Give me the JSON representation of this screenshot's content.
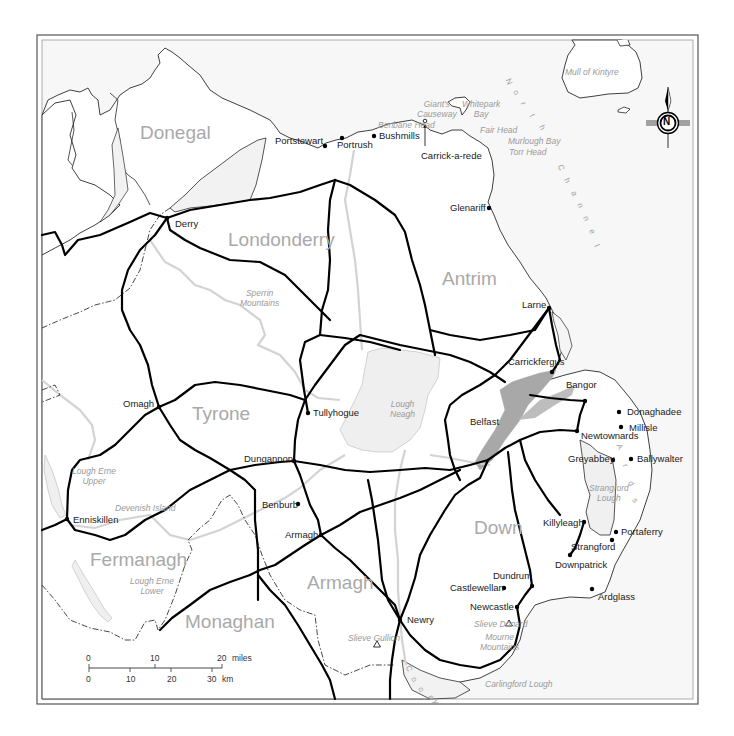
{
  "map": {
    "title": "Northern Ireland road map",
    "colors": {
      "frame": "#444444",
      "coast": "#2a2a2a",
      "road": "#000000",
      "border": "#333333",
      "river": "#d0d0d0",
      "lough": "#efefef",
      "belfast_lough": "#a8a8a8",
      "sea_label": "#a0a0a0",
      "county_label": "#a9a9a9",
      "town_label": "#1a1a1a"
    },
    "counties": [
      {
        "name": "Donegal",
        "x": 140,
        "y": 123
      },
      {
        "name": "Londonderry",
        "x": 228,
        "y": 230
      },
      {
        "name": "Antrim",
        "x": 442,
        "y": 269
      },
      {
        "name": "Tyrone",
        "x": 192,
        "y": 404
      },
      {
        "name": "Fermanagh",
        "x": 90,
        "y": 550
      },
      {
        "name": "Armagh",
        "x": 307,
        "y": 573
      },
      {
        "name": "Monaghan",
        "x": 185,
        "y": 612
      },
      {
        "name": "Down",
        "x": 474,
        "y": 518
      }
    ],
    "towns": [
      {
        "name": "Portstewart",
        "x": 275,
        "y": 136,
        "dotx": 325,
        "doty": 146
      },
      {
        "name": "Portrush",
        "x": 337,
        "y": 140,
        "dotx": 342,
        "doty": 138
      },
      {
        "name": "Bushmills",
        "x": 379,
        "y": 131,
        "dotx": 374,
        "doty": 136
      },
      {
        "name": "Carrick-a-rede",
        "x": 421,
        "y": 151,
        "dotx": 425,
        "doty": 124
      },
      {
        "name": "Glenariff",
        "x": 450,
        "y": 203,
        "dotx": 489,
        "doty": 208
      },
      {
        "name": "Derry",
        "x": 175,
        "y": 219,
        "dotx": 167,
        "doty": 218
      },
      {
        "name": "Larne",
        "x": 522,
        "y": 300,
        "dotx": 549,
        "doty": 308
      },
      {
        "name": "Carrickfergus",
        "x": 508,
        "y": 357,
        "dotx": 552,
        "doty": 372
      },
      {
        "name": "Bangor",
        "x": 566,
        "y": 380,
        "dotx": 585,
        "doty": 401
      },
      {
        "name": "Donaghadee",
        "x": 627,
        "y": 407,
        "dotx": 619,
        "doty": 412
      },
      {
        "name": "Millisle",
        "x": 629,
        "y": 423,
        "dotx": 621,
        "doty": 427
      },
      {
        "name": "Newtownards",
        "x": 581,
        "y": 431,
        "dotx": 577,
        "doty": 431
      },
      {
        "name": "Belfast",
        "x": 470,
        "y": 417,
        "dotx": null,
        "doty": null
      },
      {
        "name": "Tullyhogue",
        "x": 313,
        "y": 408,
        "dotx": 308,
        "doty": 413
      },
      {
        "name": "Omagh",
        "x": 123,
        "y": 399,
        "dotx": 159,
        "doty": 407
      },
      {
        "name": "Greyabbey",
        "x": 568,
        "y": 454,
        "dotx": 613,
        "doty": 460
      },
      {
        "name": "Ballywalter",
        "x": 637,
        "y": 454,
        "dotx": 631,
        "doty": 459
      },
      {
        "name": "Dungannon",
        "x": 244,
        "y": 454,
        "dotx": 294,
        "doty": 461
      },
      {
        "name": "Enniskillen",
        "x": 73,
        "y": 515,
        "dotx": 67,
        "doty": 519
      },
      {
        "name": "Benburb",
        "x": 262,
        "y": 500,
        "dotx": 298,
        "doty": 504
      },
      {
        "name": "Killyleagh",
        "x": 543,
        "y": 518,
        "dotx": 584,
        "doty": 522
      },
      {
        "name": "Armagh",
        "x": 285,
        "y": 530,
        "dotx": 321,
        "doty": 535
      },
      {
        "name": "Portaferry",
        "x": 621,
        "y": 527,
        "dotx": 616,
        "doty": 532
      },
      {
        "name": "Strangford",
        "x": 571,
        "y": 542,
        "dotx": 612,
        "doty": 540
      },
      {
        "name": "Downpatrick",
        "x": 555,
        "y": 560,
        "dotx": 570,
        "doty": 555
      },
      {
        "name": "Dundrum",
        "x": 493,
        "y": 571,
        "dotx": 532,
        "doty": 586
      },
      {
        "name": "Castlewellan",
        "x": 450,
        "y": 583,
        "dotx": 504,
        "doty": 588
      },
      {
        "name": "Ardglass",
        "x": 598,
        "y": 592,
        "dotx": 592,
        "doty": 589
      },
      {
        "name": "Newcastle",
        "x": 470,
        "y": 602,
        "dotx": 517,
        "doty": 607
      },
      {
        "name": "Newry",
        "x": 407,
        "y": 615,
        "dotx": 400,
        "doty": 620
      }
    ],
    "features": [
      {
        "name": "Giant's\nCauseway",
        "x": 417,
        "y": 100
      },
      {
        "name": "Whitepark\nBay",
        "x": 462,
        "y": 100
      },
      {
        "name": "Benbane Head",
        "x": 378,
        "y": 121
      },
      {
        "name": "Fair Head",
        "x": 480,
        "y": 126
      },
      {
        "name": "Murlough Bay",
        "x": 508,
        "y": 137
      },
      {
        "name": "Torr Head",
        "x": 509,
        "y": 148
      },
      {
        "name": "Mull of Kintyre",
        "x": 565,
        "y": 68
      },
      {
        "name": "Sperrin\nMountains",
        "x": 240,
        "y": 289
      },
      {
        "name": "Lough\nNeagh",
        "x": 390,
        "y": 400
      },
      {
        "name": "Lough Erne\nUpper",
        "x": 72,
        "y": 467
      },
      {
        "name": "Devenish Island",
        "x": 115,
        "y": 504
      },
      {
        "name": "Lough Erne\nLower",
        "x": 130,
        "y": 577
      },
      {
        "name": "Strangford\nLough",
        "x": 589,
        "y": 484
      },
      {
        "name": "Slieve Gullion",
        "x": 348,
        "y": 634
      },
      {
        "name": "Slieve Donard",
        "x": 474,
        "y": 620
      },
      {
        "name": "Mourne\nMountains",
        "x": 480,
        "y": 633
      },
      {
        "name": "Carlingford Lough",
        "x": 485,
        "y": 680
      }
    ],
    "peaks": [
      {
        "name": "Slieve Gullion",
        "x": 377,
        "y": 644
      },
      {
        "name": "Slieve Donard",
        "x": 509,
        "y": 623
      }
    ],
    "sea_labels": [
      {
        "name": "North Channel",
        "letters": [
          {
            "c": "N",
            "x": 506,
            "y": 77
          },
          {
            "c": "o",
            "x": 514,
            "y": 88
          },
          {
            "c": "r",
            "x": 522,
            "y": 99
          },
          {
            "c": "t",
            "x": 531,
            "y": 111
          },
          {
            "c": "h",
            "x": 540,
            "y": 123
          },
          {
            "c": "C",
            "x": 558,
            "y": 163
          },
          {
            "c": "h",
            "x": 565,
            "y": 176
          },
          {
            "c": "a",
            "x": 572,
            "y": 189
          },
          {
            "c": "n",
            "x": 578,
            "y": 201
          },
          {
            "c": "n",
            "x": 584,
            "y": 214
          },
          {
            "c": "e",
            "x": 590,
            "y": 227
          },
          {
            "c": "l",
            "x": 596,
            "y": 241
          }
        ]
      },
      {
        "name": "Ards",
        "letters": [
          {
            "c": "A",
            "x": 617,
            "y": 442
          },
          {
            "c": "r",
            "x": 624,
            "y": 461
          },
          {
            "c": "d",
            "x": 629,
            "y": 479
          },
          {
            "c": "s",
            "x": 633,
            "y": 496
          }
        ]
      },
      {
        "name": "Cooley",
        "letters": [
          {
            "c": "C",
            "x": 406,
            "y": 664
          },
          {
            "c": "o",
            "x": 412,
            "y": 675
          },
          {
            "c": "o",
            "x": 419,
            "y": 685
          },
          {
            "c": "l",
            "x": 425,
            "y": 694
          },
          {
            "c": "e",
            "x": 429,
            "y": 693
          },
          {
            "c": "y",
            "x": 434,
            "y": 697
          }
        ]
      }
    ],
    "compass": {
      "letter": "N",
      "cx": 668,
      "cy": 123
    },
    "scale_bar": {
      "miles": {
        "ticks": [
          "0",
          "10",
          "20"
        ],
        "unit": "miles"
      },
      "km": {
        "ticks": [
          "0",
          "10",
          "20",
          "30"
        ],
        "unit": "km"
      }
    }
  }
}
